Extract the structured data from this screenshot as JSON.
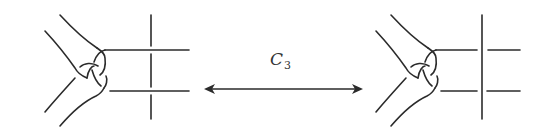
{
  "diagram": {
    "type": "knot-move-equivalence",
    "move_label": "C",
    "move_subscript": "3",
    "arrow": "bidirectional",
    "colors": {
      "stroke": "#2b2b2b",
      "background": "#ffffff"
    },
    "panels": [
      {
        "id": "left",
        "description": "trefoil-like tangle with vertical strand passing under two horizontal strands"
      },
      {
        "id": "right",
        "description": "trefoil-like tangle with vertical strand passing over two horizontal strands"
      }
    ]
  }
}
